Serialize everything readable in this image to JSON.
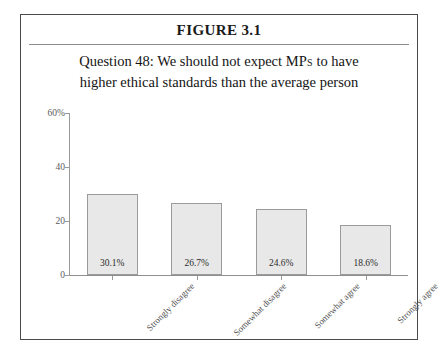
{
  "figure": {
    "title": "FIGURE 3.1",
    "subtitle_line1_pre": "Question 48: We should not expect ",
    "subtitle_line1_smallcaps": "MPs",
    "subtitle_line1_post": " to have",
    "subtitle_line2": "higher ethical standards than the average person"
  },
  "colors": {
    "bar_fill": "#e8e8e8",
    "bar_border": "#9b9b9b",
    "axis": "#9a9a9a",
    "frame": "#4a4a4a",
    "text": "#141414"
  },
  "chart_data": {
    "type": "bar",
    "title": "Question 48: We should not expect MPs to have higher ethical standards than the average person",
    "categories": [
      "Strongly disagree",
      "Somewhat disagree",
      "Somewhat agree",
      "Strongly agree"
    ],
    "values": [
      30.1,
      26.7,
      24.6,
      18.6
    ],
    "data_labels": [
      "30.1%",
      "26.7%",
      "24.6%",
      "18.6%"
    ],
    "xlabel": "",
    "ylabel": "",
    "ylim": [
      0,
      60
    ],
    "yticks": [
      0,
      20,
      40,
      60
    ],
    "ytick_labels": [
      "0",
      "20",
      "40",
      "60%"
    ],
    "grid": false,
    "legend": false
  }
}
